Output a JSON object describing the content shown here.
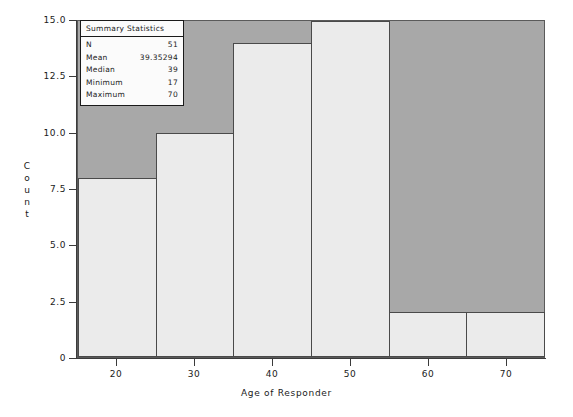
{
  "chart_data": {
    "type": "bar",
    "chart_subtype": "histogram",
    "title": "",
    "xlabel": "Age of Responder",
    "ylabel": "Count",
    "xlim": [
      15,
      75
    ],
    "ylim": [
      0,
      15
    ],
    "bin_width": 10,
    "bin_edges": [
      15,
      25,
      35,
      45,
      55,
      65,
      75
    ],
    "categories": [
      "15-25",
      "25-35",
      "35-45",
      "45-55",
      "55-65",
      "65-75"
    ],
    "values": [
      8,
      10,
      14,
      15,
      2,
      2
    ],
    "x_ticks": [
      20,
      30,
      40,
      50,
      60,
      70
    ],
    "x_tick_labels": [
      "20",
      "30",
      "40",
      "50",
      "60",
      "70"
    ],
    "y_ticks": [
      0,
      2.5,
      5.0,
      7.5,
      10.0,
      12.5,
      15.0
    ],
    "y_tick_labels": [
      "0",
      "2.5",
      "5.0",
      "7.5",
      "10.0",
      "12.5",
      "15.0"
    ],
    "grid": false,
    "legend": "none",
    "colors": {
      "plot_background": "#a8a8a8",
      "bar_fill": "#ebebeb",
      "bar_edge": "#4a4a4a",
      "axis": "#3b3b3b",
      "text": "#1a1a1a",
      "box_background": "#fbfbfb",
      "box_border": "#1a1a1a"
    }
  },
  "summary_box": {
    "title": "Summary Statistics",
    "rows": [
      {
        "label": "N",
        "value": "51"
      },
      {
        "label": "Mean",
        "value": "39.35294"
      },
      {
        "label": "Median",
        "value": "39"
      },
      {
        "label": "Minimum",
        "value": "17"
      },
      {
        "label": "Maximum",
        "value": "70"
      }
    ]
  },
  "axis_titles": {
    "x": "Age of Responder",
    "y_letters": [
      "C",
      "o",
      "u",
      "n",
      "t"
    ]
  }
}
